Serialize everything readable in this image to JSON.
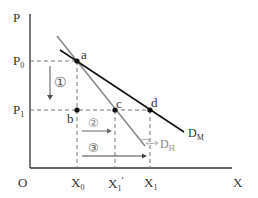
{
  "axes": {
    "y_label": "P",
    "x_label": "X",
    "origin_label": "O"
  },
  "y_ticks": [
    {
      "main": "P",
      "sub": "0"
    },
    {
      "main": "P",
      "sub": "1"
    }
  ],
  "x_ticks": [
    {
      "main": "X",
      "sub": "0",
      "prime": ""
    },
    {
      "main": "X",
      "sub": "1",
      "prime": "′"
    },
    {
      "main": "X",
      "sub": "1",
      "prime": ""
    }
  ],
  "points": {
    "a": "a",
    "b": "b",
    "c": "c",
    "d": "d"
  },
  "curves": {
    "dm": {
      "main": "D",
      "sub": "M",
      "color": "#111111"
    },
    "dh": {
      "main": "D",
      "sub": "H",
      "color": "#888888"
    }
  },
  "markers": {
    "m1": "①",
    "m2": "②",
    "m3": "③"
  },
  "colors": {
    "axis": "#333333",
    "dashed": "#777777",
    "dm_line": "#111111",
    "dh_line": "#8a8a8a"
  }
}
